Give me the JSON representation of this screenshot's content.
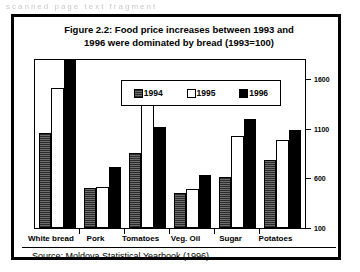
{
  "page_artifact": {
    "text": "scanned page text fragment"
  },
  "figure": {
    "title_line_1": "Figure 2.2: Food price increases between 1993 and",
    "title_line_2": "1996 were dominated by bread (1993=100)",
    "source": "Source:  Moldova Statistical Yearbook (1996)."
  },
  "legend": {
    "items": [
      {
        "label": "1994",
        "swatch": "dark-gray-hatch",
        "color": "#4a4a4a"
      },
      {
        "label": "1995",
        "swatch": "white-fill",
        "color": "#ffffff"
      },
      {
        "label": "1996",
        "swatch": "black-fill",
        "color": "#000000"
      }
    ]
  },
  "chart_data": {
    "type": "bar",
    "title": "Figure 2.2: Food price increases between 1993 and 1996 were dominated by bread (1993=100)",
    "xlabel": "",
    "ylabel": "",
    "ylim": [
      100,
      1800
    ],
    "yticks": [
      100,
      600,
      1100,
      1600
    ],
    "ytick_labels": [
      "100",
      "600",
      "1100",
      "1600"
    ],
    "grid": false,
    "legend_position": "top-center-inside",
    "categories": [
      "White bread",
      "Pork",
      "Tomatoes",
      "Veg. Oil",
      "Sugar",
      "Potatoes"
    ],
    "series": [
      {
        "name": "1994",
        "values": [
          1060,
          500,
          860,
          450,
          620,
          790
        ]
      },
      {
        "name": "1995",
        "values": [
          1520,
          510,
          1430,
          490,
          1030,
          990
        ]
      },
      {
        "name": "1996",
        "values": [
          1810,
          720,
          1120,
          640,
          1200,
          1090
        ]
      }
    ]
  }
}
